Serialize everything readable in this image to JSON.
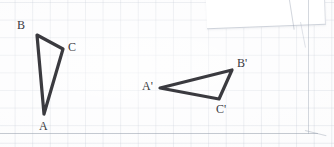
{
  "document": {
    "kind": "scanned-graph-paper-worksheet",
    "title": "Triangle transformation on graph paper",
    "ink_color": "#3a3a3f",
    "grid_color": "#b2bac8",
    "paper_color": "#fcfcfd",
    "grid_spacing_px": 17.6
  },
  "figures": [
    {
      "name": "triangle-abc",
      "kind": "triangle",
      "stroke_width": 3.2,
      "vertices": [
        {
          "label": "A",
          "x": 44,
          "y": 114,
          "label_x": 39,
          "label_y": 120
        },
        {
          "label": "B",
          "x": 37,
          "y": 35,
          "label_x": 17,
          "label_y": 19
        },
        {
          "label": "C",
          "x": 63,
          "y": 49,
          "label_x": 68,
          "label_y": 41
        }
      ]
    },
    {
      "name": "triangle-a-prime-b-prime-c-prime",
      "kind": "triangle",
      "stroke_width": 3.2,
      "vertices": [
        {
          "label": "A'",
          "x": 160,
          "y": 88,
          "label_x": 142,
          "label_y": 80
        },
        {
          "label": "B'",
          "x": 232,
          "y": 70,
          "label_x": 237,
          "label_y": 57
        },
        {
          "label": "C'",
          "x": 219,
          "y": 99,
          "label_x": 216,
          "label_y": 103
        }
      ]
    }
  ],
  "sheet_edges": {
    "bottom_label": "page-bottom-edge",
    "right_label": "page-right-edge",
    "overlap_label": "overlapping-sheet-corner"
  }
}
